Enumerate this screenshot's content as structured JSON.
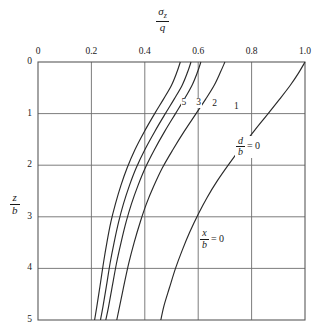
{
  "chart_data": {
    "type": "line",
    "title": "",
    "xlabel_numerator": "σ",
    "xlabel_numerator_sub": "z",
    "xlabel_denominator": "q",
    "ylabel_numerator": "z",
    "ylabel_denominator": "b",
    "xlim": [
      0,
      1.0
    ],
    "ylim": [
      0,
      5
    ],
    "y_inverted": true,
    "grid": true,
    "xticks": [
      "0",
      "0.2",
      "0.4",
      "0.6",
      "0.8",
      "1.0"
    ],
    "xtick_values": [
      0,
      0.2,
      0.4,
      0.6,
      0.8,
      1.0
    ],
    "yticks": [
      "0",
      "1",
      "2",
      "3",
      "4",
      "5"
    ],
    "ytick_values": [
      0,
      1,
      2,
      3,
      4,
      5
    ],
    "legend_position": "inline-curve-labels",
    "annotations": [
      {
        "name": "d-over-b",
        "numerator": "d",
        "denominator": "b",
        "equals": "= 0"
      },
      {
        "name": "x-over-b",
        "numerator": "x",
        "denominator": "b",
        "equals": "= 0"
      }
    ],
    "series": [
      {
        "name": "5",
        "label": "5",
        "points": [
          [
            0.533,
            0.0
          ],
          [
            0.52,
            0.2
          ],
          [
            0.5,
            0.45
          ],
          [
            0.47,
            0.72
          ],
          [
            0.437,
            1.0
          ],
          [
            0.398,
            1.35
          ],
          [
            0.363,
            1.7
          ],
          [
            0.334,
            2.05
          ],
          [
            0.31,
            2.4
          ],
          [
            0.29,
            2.75
          ],
          [
            0.273,
            3.1
          ],
          [
            0.258,
            3.5
          ],
          [
            0.245,
            3.9
          ],
          [
            0.232,
            4.35
          ],
          [
            0.22,
            4.75
          ],
          [
            0.212,
            5.0
          ]
        ]
      },
      {
        "name": "3",
        "label": "3",
        "points": [
          [
            0.573,
            0.0
          ],
          [
            0.56,
            0.2
          ],
          [
            0.54,
            0.45
          ],
          [
            0.51,
            0.72
          ],
          [
            0.477,
            1.0
          ],
          [
            0.437,
            1.35
          ],
          [
            0.4,
            1.7
          ],
          [
            0.368,
            2.05
          ],
          [
            0.342,
            2.4
          ],
          [
            0.32,
            2.75
          ],
          [
            0.302,
            3.1
          ],
          [
            0.285,
            3.5
          ],
          [
            0.27,
            3.9
          ],
          [
            0.256,
            4.35
          ],
          [
            0.243,
            4.75
          ],
          [
            0.234,
            5.0
          ]
        ]
      },
      {
        "name": "2",
        "label": "2",
        "points": [
          [
            0.61,
            0.0
          ],
          [
            0.597,
            0.2
          ],
          [
            0.577,
            0.45
          ],
          [
            0.548,
            0.72
          ],
          [
            0.515,
            1.0
          ],
          [
            0.474,
            1.35
          ],
          [
            0.436,
            1.7
          ],
          [
            0.402,
            2.05
          ],
          [
            0.374,
            2.4
          ],
          [
            0.35,
            2.75
          ],
          [
            0.33,
            3.1
          ],
          [
            0.311,
            3.5
          ],
          [
            0.294,
            3.9
          ],
          [
            0.278,
            4.35
          ],
          [
            0.264,
            4.75
          ],
          [
            0.254,
            5.0
          ]
        ]
      },
      {
        "name": "1",
        "label": "1",
        "points": [
          [
            0.7,
            0.0
          ],
          [
            0.683,
            0.2
          ],
          [
            0.66,
            0.45
          ],
          [
            0.628,
            0.72
          ],
          [
            0.592,
            1.0
          ],
          [
            0.547,
            1.35
          ],
          [
            0.505,
            1.7
          ],
          [
            0.466,
            2.05
          ],
          [
            0.434,
            2.4
          ],
          [
            0.406,
            2.75
          ],
          [
            0.383,
            3.1
          ],
          [
            0.36,
            3.5
          ],
          [
            0.34,
            3.9
          ],
          [
            0.321,
            4.35
          ],
          [
            0.305,
            4.75
          ],
          [
            0.295,
            5.0
          ]
        ]
      },
      {
        "name": "0",
        "label": "",
        "points": [
          [
            1.0,
            0.0
          ],
          [
            0.975,
            0.22
          ],
          [
            0.945,
            0.45
          ],
          [
            0.905,
            0.72
          ],
          [
            0.862,
            1.0
          ],
          [
            0.812,
            1.32
          ],
          [
            0.762,
            1.65
          ],
          [
            0.715,
            1.98
          ],
          [
            0.672,
            2.3
          ],
          [
            0.634,
            2.62
          ],
          [
            0.6,
            2.95
          ],
          [
            0.568,
            3.3
          ],
          [
            0.54,
            3.65
          ],
          [
            0.515,
            4.0
          ],
          [
            0.492,
            4.38
          ],
          [
            0.472,
            4.72
          ],
          [
            0.46,
            5.0
          ]
        ]
      }
    ],
    "curve_label_positions": [
      {
        "label": "5",
        "x": 0.545,
        "y": 0.8
      },
      {
        "label": "3",
        "x": 0.6,
        "y": 0.8
      },
      {
        "label": "2",
        "x": 0.66,
        "y": 0.82
      },
      {
        "label": "1",
        "x": 0.742,
        "y": 0.88
      }
    ],
    "annotation_positions": [
      {
        "name": "d-over-b",
        "x": 0.775,
        "y": 1.62
      },
      {
        "name": "x-over-b",
        "x": 0.64,
        "y": 3.42
      }
    ]
  }
}
